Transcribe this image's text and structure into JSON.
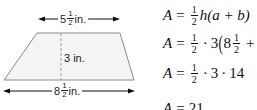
{
  "diagram": {
    "shape": "trapezoid",
    "top_base": {
      "whole": "5",
      "num": "1",
      "den": "2",
      "unit": "in."
    },
    "height": {
      "label": "3 in."
    },
    "bottom_base": {
      "whole": "8",
      "num": "1",
      "den": "2",
      "unit": "in."
    },
    "colors": {
      "fill": "#f4f4f4",
      "stroke": "#8a8a8a",
      "arrow": "#111111",
      "dash": "#9a9a9a"
    }
  },
  "equations": [
    {
      "lhs": "A",
      "eq": "=",
      "frac": {
        "num": "1",
        "den": "2"
      },
      "rest": "h(a + b)"
    },
    {
      "lhs": "A",
      "eq": "=",
      "frac": {
        "num": "1",
        "den": "2"
      },
      "dot1": "·",
      "three": "3",
      "paren": "(",
      "mixed_whole": "8",
      "mixed_frac": {
        "num": "1",
        "den": "2"
      },
      "plus": "+"
    },
    {
      "lhs": "A",
      "eq": "=",
      "frac": {
        "num": "1",
        "den": "2"
      },
      "dot1": "·",
      "three": "3",
      "dot2": "·",
      "fourteen": "14"
    },
    {
      "lhs": "A",
      "eq": "=",
      "value": "21"
    }
  ]
}
